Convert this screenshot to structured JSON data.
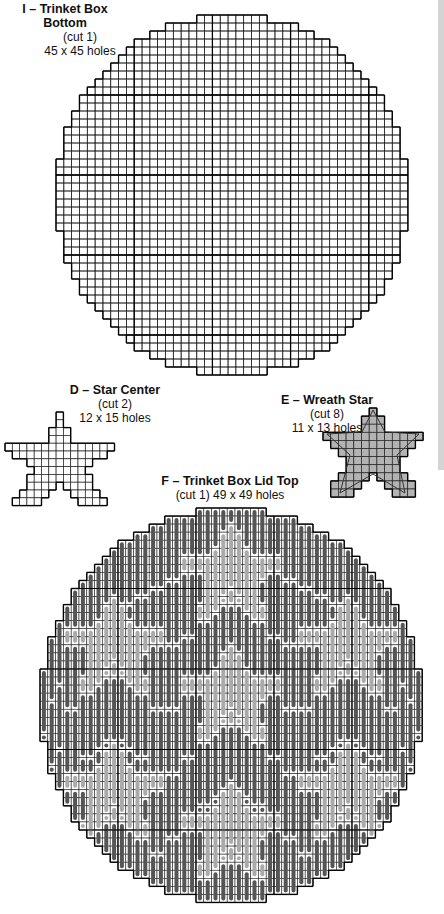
{
  "pieces": [
    {
      "id": "I",
      "title": "I – Trinket Box Bottom",
      "cut": "(cut 1)",
      "size": "45 x 45 holes",
      "labelLayout": "stacked"
    },
    {
      "id": "D",
      "title": "D – Star Center",
      "cut": "(cut 2)",
      "size": "12 x 15 holes",
      "labelLayout": "stacked"
    },
    {
      "id": "E",
      "title": "E – Wreath Star",
      "cut": "(cut 8)",
      "size": "11 x 13 holes",
      "labelLayout": "stacked"
    },
    {
      "id": "F",
      "title": "F – Trinket Box Lid Top",
      "cut_and_size": "(cut 1) 49 x 49 holes",
      "labelLayout": "two-line"
    }
  ],
  "colors": {
    "grid_line": "#222222",
    "grid_heavy": "#000000",
    "stitch_dark": "#555555",
    "stitch_light": "#aaaaaa",
    "wreath_fill": "#b3b3b3",
    "background": "#ffffff"
  },
  "legend_strip": {
    "visible": true
  }
}
